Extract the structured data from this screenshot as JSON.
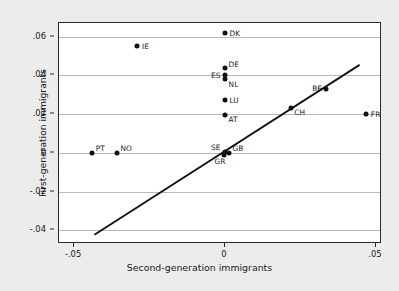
{
  "chart_data": {
    "type": "scatter",
    "title": "",
    "xlabel": "Second-generation immigrants",
    "ylabel": "First-generation immigrants",
    "xlim": [
      -0.055,
      0.052
    ],
    "ylim": [
      -0.047,
      0.067
    ],
    "xticks": [
      "-.05",
      "0",
      ".05"
    ],
    "xtick_values": [
      -0.05,
      0,
      0.05
    ],
    "yticks": [
      ".06",
      ".04",
      ".02",
      "0",
      "-.02",
      "-.04"
    ],
    "ytick_values": [
      0.06,
      0.04,
      0.02,
      0,
      -0.02,
      -0.04
    ],
    "grid": "horizontal",
    "legend": "none",
    "points": [
      {
        "label": "DK",
        "x": 0.0,
        "y": 0.062,
        "label_pos": "right"
      },
      {
        "label": "IE",
        "x": -0.029,
        "y": 0.055,
        "label_pos": "right"
      },
      {
        "label": "DE",
        "x": 0.0,
        "y": 0.0437,
        "label_pos": "upper-right"
      },
      {
        "label": "ES",
        "x": 0.0,
        "y": 0.04,
        "label_pos": "left"
      },
      {
        "label": "NL",
        "x": 0.0,
        "y": 0.038,
        "label_pos": "lower-right"
      },
      {
        "label": "BE",
        "x": 0.0335,
        "y": 0.0332,
        "label_pos": "left"
      },
      {
        "label": "LU",
        "x": 0.0,
        "y": 0.0272,
        "label_pos": "right"
      },
      {
        "label": "CH",
        "x": 0.0218,
        "y": 0.0232,
        "label_pos": "lower-right"
      },
      {
        "label": "FR",
        "x": 0.0468,
        "y": 0.0202,
        "label_pos": "right"
      },
      {
        "label": "AT",
        "x": 0.0,
        "y": 0.0196,
        "label_pos": "lower-right"
      },
      {
        "label": "PT",
        "x": -0.044,
        "y": 0.0,
        "label_pos": "upper-right"
      },
      {
        "label": "NO",
        "x": -0.0358,
        "y": 0.0,
        "label_pos": "upper-right"
      },
      {
        "label": "SE",
        "x": 0.0,
        "y": 0.0003,
        "label_pos": "upper-left"
      },
      {
        "label": "GB",
        "x": 0.0013,
        "y": 0.0,
        "label_pos": "upper-right"
      },
      {
        "label": "GR",
        "x": -0.0005,
        "y": -0.0012,
        "label_pos": "lower-left"
      }
    ],
    "trendline": {
      "x0": -0.0432,
      "y0": -0.0432,
      "x1": 0.0452,
      "y1": 0.0452,
      "slope": 1.0,
      "intercept": 0.0
    },
    "colors": {
      "point": "#111111",
      "line": "#111111",
      "grid": "#b9b9b9",
      "frame": "#2b2b2b",
      "plot_background": "#ffffff",
      "page_background": "#ececed"
    }
  }
}
